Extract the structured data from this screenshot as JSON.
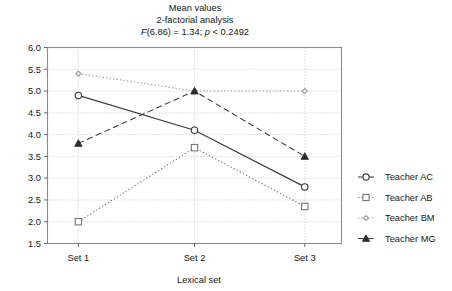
{
  "chart_data": {
    "type": "line",
    "title": "Mean values",
    "subtitle": "2-factorial analysis",
    "stat_line": "F(6.86) = 1.34; p < 0.2492",
    "stat_parts": {
      "f_symbol": "F",
      "f_rest": "(6.86) = 1.34; ",
      "p_symbol": "p",
      "p_rest": " < 0.2492"
    },
    "xlabel": "Lexical set",
    "ylabel": "",
    "categories": [
      "Set 1",
      "Set 2",
      "Set 3"
    ],
    "ylim": [
      1.5,
      6.0
    ],
    "ytick_labels": [
      "6.0",
      "5.5",
      "5.0",
      "4.5",
      "4.0",
      "3.5",
      "3.0",
      "2.5",
      "2.0",
      "1.5"
    ],
    "ytick_values": [
      6.0,
      5.5,
      5.0,
      4.5,
      4.0,
      3.5,
      3.0,
      2.5,
      2.0,
      1.5
    ],
    "grid": true,
    "legend_position": "right",
    "series": [
      {
        "name": "Teacher AC",
        "marker": "open-circle",
        "line_style": "solid",
        "color": "#3a3a3a",
        "values": [
          4.9,
          4.1,
          2.8
        ]
      },
      {
        "name": "Teacher AB",
        "marker": "open-square",
        "line_style": "dotted",
        "color": "#767676",
        "values": [
          2.0,
          3.7,
          2.35
        ]
      },
      {
        "name": "Teacher BM",
        "marker": "open-diamond",
        "line_style": "dotted",
        "color": "#9a9a9a",
        "values": [
          5.4,
          5.0,
          5.0
        ]
      },
      {
        "name": "Teacher MG",
        "marker": "filled-triangle",
        "line_style": "dashed",
        "color": "#3a3a3a",
        "values": [
          3.8,
          5.0,
          3.5
        ]
      }
    ]
  },
  "legend": {
    "items": [
      {
        "label": "Teacher AC"
      },
      {
        "label": "Teacher AB"
      },
      {
        "label": "Teacher BM"
      },
      {
        "label": "Teacher MG"
      }
    ]
  }
}
